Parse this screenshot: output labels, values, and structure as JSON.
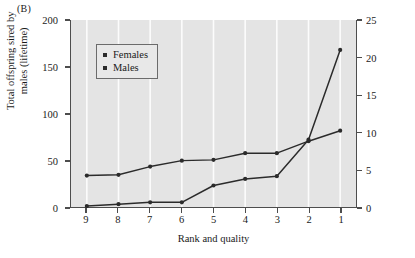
{
  "panel": {
    "label": "(B)"
  },
  "legend": {
    "entries": [
      {
        "label": "Females",
        "marker": "square-marker",
        "color": "#2b2b2b"
      },
      {
        "label": "Males",
        "marker": "square-marker",
        "color": "#2b2b2b"
      }
    ]
  },
  "axes": {
    "left": {
      "title": "Total offspring sired by males (lifetime)",
      "ticks": [
        "0",
        "50",
        "100",
        "150",
        "200"
      ],
      "values": [
        0,
        50,
        100,
        150,
        200
      ]
    },
    "right": {
      "title": "Total offspring produced by females (lifetime)",
      "ticks": [
        "0",
        "5",
        "10",
        "15",
        "20",
        "25"
      ],
      "values": [
        0,
        5,
        10,
        15,
        20,
        25
      ]
    },
    "bottom": {
      "title": "Rank and quality",
      "ticks": [
        "9",
        "8",
        "7",
        "6",
        "5",
        "4",
        "3",
        "2",
        "1"
      ]
    }
  },
  "chart_data": {
    "type": "line",
    "title": "(B)",
    "xlabel": "Rank and quality",
    "ylabel": "Total offspring sired by males (lifetime)",
    "y2label": "Total offspring produced by females (lifetime)",
    "categories": [
      "9",
      "8",
      "7",
      "6",
      "5",
      "4",
      "3",
      "2",
      "1"
    ],
    "ylim": [
      0,
      200
    ],
    "y2lim": [
      0,
      25
    ],
    "grid": true,
    "legend_position": "upper-left-inside",
    "series": [
      {
        "name": "Females",
        "axis": "right",
        "color": "#2b2b2b",
        "marker": "circle",
        "values": [
          4.2,
          4.3,
          5.4,
          6.2,
          6.3,
          7.2,
          7.2,
          8.8,
          10.2
        ]
      },
      {
        "name": "Males",
        "axis": "left",
        "color": "#2b2b2b",
        "marker": "circle",
        "values": [
          1,
          3,
          5,
          5,
          23,
          30,
          33,
          72,
          168
        ]
      }
    ]
  },
  "colors": {
    "plot_background": "#e4e4e4",
    "gridline": "#fcfcfc",
    "axis": "#4d4d4d",
    "series": "#2b2b2b",
    "text": "#1a1a1a",
    "page_background": "#ffffff"
  }
}
